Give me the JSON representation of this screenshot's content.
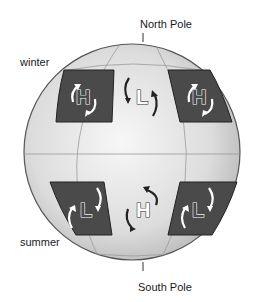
{
  "labels": {
    "north_pole": "North Pole",
    "south_pole": "South Pole",
    "winter": "winter",
    "summer": "summer"
  },
  "pressure_systems": {
    "north_left": "H",
    "north_center": "L",
    "north_right": "H",
    "south_left": "L",
    "south_center": "H",
    "south_right": "L"
  },
  "colors": {
    "globe_fill": "#e6e6e6",
    "globe_edge": "#555555",
    "panel_fill": "#4a4a4a",
    "grid_line": "#9a9a9a"
  }
}
